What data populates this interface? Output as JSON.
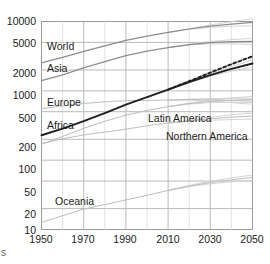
{
  "axes": {
    "y_ticks": [
      "10000",
      "5000",
      "2000",
      "1000",
      "500",
      "200",
      "100",
      "50",
      "20",
      "10"
    ],
    "x_ticks": [
      "1950",
      "1970",
      "1990",
      "2010",
      "2030",
      "2050"
    ]
  },
  "series_labels": {
    "world": "World",
    "asia": "Asia",
    "europe": "Europe",
    "africa": "Africa",
    "latin_america": "Latin America",
    "northern_america": "Northern America",
    "oceania": "Oceania"
  },
  "stray_text": "s",
  "colors": {
    "frame": "#9b9b9b",
    "grid_major": "#b9b9b9",
    "grid_minor": "#e2e2e2",
    "line_dark": "#1f1f1f",
    "line_mid": "#8d8d8d",
    "line_light": "#bdbdbd",
    "fan": "#cfcfcf",
    "text": "#1b1b1b"
  },
  "chart_data": {
    "type": "line",
    "title": "",
    "xlabel": "",
    "ylabel": "",
    "xlim": [
      1950,
      2050
    ],
    "ylim": [
      10,
      10000
    ],
    "yscale": "log",
    "xscale": "linear",
    "grid": true,
    "legend_position": "inline-labels",
    "y_tick_values": [
      10,
      20,
      50,
      100,
      200,
      500,
      1000,
      2000,
      5000,
      10000
    ],
    "x_tick_values": [
      1950,
      1970,
      1990,
      2010,
      2030,
      2050
    ],
    "x_minor_step": 10,
    "units": "millions of people",
    "annotations": [
      {
        "text": "World",
        "x": 1953,
        "y": 3650
      },
      {
        "text": "Asia",
        "x": 1953,
        "y": 1750
      },
      {
        "text": "Europe",
        "x": 1953,
        "y": 760
      },
      {
        "text": "Africa",
        "x": 1953,
        "y": 400
      },
      {
        "text": "Latin America",
        "x": 1998,
        "y": 380
      },
      {
        "text": "Northern America",
        "x": 2012,
        "y": 265
      },
      {
        "text": "Oceania",
        "x": 1955,
        "y": 23
      }
    ],
    "x": [
      1950,
      1960,
      1970,
      1980,
      1990,
      2000,
      2010,
      2020,
      2030,
      2040,
      2050
    ],
    "series": [
      {
        "name": "World",
        "style": "solid",
        "emphasis": "medium",
        "projection_from": 2010,
        "values": [
          2536,
          3033,
          3700,
          4458,
          5327,
          6144,
          6957,
          7795,
          8551,
          9198,
          9735
        ],
        "projection_high": [
          null,
          null,
          null,
          null,
          null,
          null,
          6957,
          7900,
          8900,
          9950,
          10900
        ],
        "projection_low": [
          null,
          null,
          null,
          null,
          null,
          null,
          6957,
          7700,
          8250,
          8550,
          8700
        ]
      },
      {
        "name": "Asia",
        "style": "solid",
        "emphasis": "medium",
        "projection_from": 2010,
        "values": [
          1404,
          1700,
          2138,
          2642,
          3226,
          3741,
          4194,
          4641,
          4947,
          5109,
          5157
        ],
        "projection_high": [
          null,
          null,
          null,
          null,
          null,
          null,
          4194,
          4700,
          5140,
          5480,
          5700
        ],
        "projection_low": [
          null,
          null,
          null,
          null,
          null,
          null,
          4194,
          4580,
          4760,
          4760,
          4650
        ]
      },
      {
        "name": "Europe",
        "style": "solid",
        "emphasis": "light",
        "projection_from": 2010,
        "values": [
          549,
          605,
          657,
          694,
          721,
          727,
          736,
          748,
          741,
          728,
          710
        ],
        "projection_high": [
          null,
          null,
          null,
          null,
          null,
          null,
          736,
          760,
          775,
          780,
          780
        ],
        "projection_low": [
          null,
          null,
          null,
          null,
          null,
          null,
          736,
          736,
          710,
          676,
          640
        ]
      },
      {
        "name": "Africa",
        "style": "solid",
        "emphasis": "dark",
        "projection_from": 2010,
        "values": [
          229,
          285,
          366,
          478,
          632,
          814,
          1044,
          1341,
          1688,
          2077,
          2478
        ],
        "projection_high": [
          null,
          null,
          null,
          null,
          null,
          null,
          1044,
          1360,
          1760,
          2240,
          2790
        ],
        "projection_low": [
          null,
          null,
          null,
          null,
          null,
          null,
          1044,
          1320,
          1620,
          1920,
          2200
        ]
      },
      {
        "name": "Latin America",
        "style": "solid",
        "emphasis": "light",
        "projection_from": 2010,
        "values": [
          169,
          220,
          288,
          364,
          446,
          522,
          591,
          654,
          703,
          733,
          750
        ],
        "projection_high": [
          null,
          null,
          null,
          null,
          null,
          null,
          591,
          665,
          735,
          790,
          830
        ],
        "projection_low": [
          null,
          null,
          null,
          null,
          null,
          null,
          591,
          645,
          675,
          685,
          680
        ]
      },
      {
        "name": "Northern America",
        "style": "solid",
        "emphasis": "light",
        "projection_from": 2010,
        "values": [
          173,
          204,
          231,
          254,
          280,
          313,
          343,
          369,
          395,
          417,
          435
        ],
        "projection_high": [
          null,
          null,
          null,
          null,
          null,
          null,
          343,
          378,
          415,
          450,
          480
        ],
        "projection_low": [
          null,
          null,
          null,
          null,
          null,
          null,
          343,
          362,
          376,
          386,
          392
        ]
      },
      {
        "name": "Oceania",
        "style": "solid",
        "emphasis": "light",
        "projection_from": 2010,
        "values": [
          12.6,
          15.8,
          19.7,
          22.9,
          26.7,
          31.1,
          36.6,
          42.4,
          47.5,
          52.0,
          56.6
        ],
        "projection_high": [
          null,
          null,
          null,
          null,
          null,
          null,
          36.6,
          43.2,
          49.5,
          55.5,
          61.0
        ],
        "projection_low": [
          null,
          null,
          null,
          null,
          null,
          null,
          36.6,
          41.6,
          45.6,
          48.8,
          51.5
        ]
      },
      {
        "name": "World (dashed variant)",
        "style": "dashed",
        "emphasis": "dark",
        "projection_from": 2010,
        "values": [
          null,
          null,
          null,
          null,
          null,
          null,
          1044,
          1380,
          1830,
          2420,
          3150
        ]
      }
    ]
  }
}
